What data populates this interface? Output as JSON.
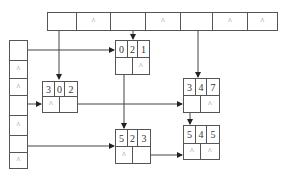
{
  "diagram": {
    "type": "orthogonal-list-sparse-matrix",
    "null_symbol": "^",
    "column_heads": [
      "",
      "^",
      "",
      "^",
      "",
      "^",
      "^"
    ],
    "row_heads": [
      "",
      "^",
      "^",
      "",
      "^",
      "",
      "^"
    ],
    "nodes": [
      {
        "id": "n021",
        "row": "0",
        "col": "2",
        "val": "1",
        "down": "",
        "right": "^"
      },
      {
        "id": "n302",
        "row": "3",
        "col": "0",
        "val": "2",
        "down": "^",
        "right": ""
      },
      {
        "id": "n347",
        "row": "3",
        "col": "4",
        "val": "7",
        "down": "",
        "right": "^"
      },
      {
        "id": "n523",
        "row": "5",
        "col": "2",
        "val": "3",
        "down": "^",
        "right": ""
      },
      {
        "id": "n545",
        "row": "5",
        "col": "4",
        "val": "5",
        "down": "^",
        "right": "^"
      }
    ]
  }
}
